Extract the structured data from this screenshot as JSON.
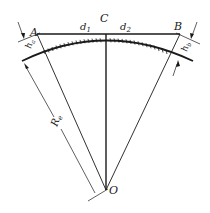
{
  "diagram": {
    "points": {
      "A": "A",
      "B": "B",
      "C": "C",
      "O": "O"
    },
    "distances": {
      "d1": "d",
      "d1_sub": "1",
      "d2": "d",
      "d2_sub": "2"
    },
    "dimensions": {
      "h_left": "h",
      "h_left_sub": "a",
      "h_right": "h",
      "h_right_sub": "b",
      "radius": "R",
      "radius_sub": "e"
    },
    "colors": {
      "line": "#1a1a1a",
      "background": "#ffffff"
    }
  }
}
